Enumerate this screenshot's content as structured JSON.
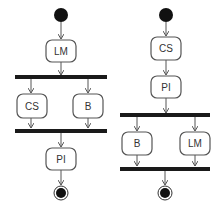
{
  "diagrams": [
    {
      "name": "left-activity-diagram",
      "nodes": {
        "start": "initial",
        "a1": "LM",
        "fork": "fork",
        "p1": "CS",
        "p2": "B",
        "join": "join",
        "a2": "PI",
        "end": "final"
      }
    },
    {
      "name": "right-activity-diagram",
      "nodes": {
        "start": "initial",
        "a1": "CS",
        "a2": "PI",
        "fork": "fork",
        "p1": "B",
        "p2": "LM",
        "join": "join",
        "end": "final"
      }
    }
  ],
  "colors": {
    "bar": "#1a1a1a",
    "node_stroke": "#555555",
    "text": "#333333"
  }
}
